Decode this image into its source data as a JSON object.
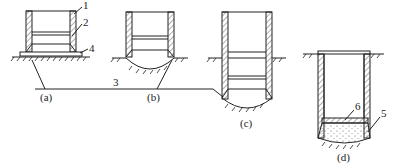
{
  "diagram": {
    "stroke_color": "#222222",
    "background": "#ffffff",
    "panels": [
      {
        "id": "a",
        "label": "(a)"
      },
      {
        "id": "b",
        "label": "(b)"
      },
      {
        "id": "c",
        "label": "(c)"
      },
      {
        "id": "d",
        "label": "(d)"
      }
    ],
    "callouts": [
      {
        "number": "1",
        "target": "caisson wall"
      },
      {
        "number": "2",
        "target": "cutting edge ring"
      },
      {
        "number": "3",
        "target": "sinking path line"
      },
      {
        "number": "4",
        "target": "base pad"
      },
      {
        "number": "5",
        "target": "bottom seal concrete"
      },
      {
        "number": "6",
        "target": "bottom slab"
      }
    ]
  }
}
